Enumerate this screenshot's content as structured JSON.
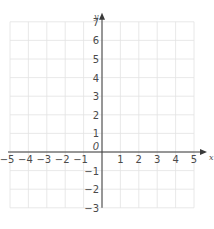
{
  "chart_data": {
    "type": "scatter",
    "title": "",
    "xlabel": "x",
    "ylabel": "y",
    "xlim": [
      -5,
      5
    ],
    "ylim": [
      -3,
      7
    ],
    "grid": true,
    "x_ticks": [
      -5,
      -4,
      -3,
      -2,
      -1,
      1,
      2,
      3,
      4,
      5
    ],
    "y_ticks": [
      -3,
      -2,
      -1,
      1,
      2,
      3,
      4,
      5,
      6,
      7
    ],
    "x_tick_labels": [
      "−5",
      "−4",
      "−3",
      "−2",
      "−1",
      "1",
      "2",
      "3",
      "4",
      "5"
    ],
    "y_tick_labels": [
      "−3",
      "−2",
      "−1",
      "1",
      "2",
      "3",
      "4",
      "5",
      "6",
      "7"
    ],
    "origin_label": "0",
    "series": [],
    "legend": null
  },
  "colors": {
    "grid": "#e2e2e2",
    "axis": "#3a3a3a",
    "text": "#4a4a4a"
  }
}
